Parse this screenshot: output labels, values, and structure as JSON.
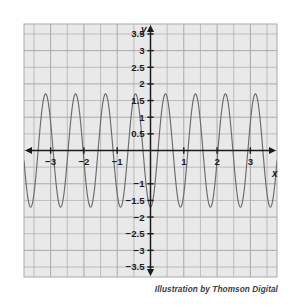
{
  "figure": {
    "caption": "Illustration by Thomson Digital",
    "background_color": "#ffffff",
    "plot_background_color": "#e9e9e9",
    "grid_color": "#a9a9a9",
    "axis_color": "#1c1c1c",
    "curve_color": "#6b6b6b"
  },
  "chart_data": {
    "type": "line",
    "title": "",
    "subtitle": "",
    "xlabel": "x",
    "ylabel": "y",
    "xlim": [
      -3.8,
      3.8
    ],
    "ylim": [
      -3.8,
      3.8
    ],
    "xticks": [
      -3,
      -2,
      -1,
      1,
      2,
      3
    ],
    "xtick_labels": [
      "-3",
      "-2",
      "-1",
      "1",
      "2",
      "3"
    ],
    "yticks": [
      3.5,
      3,
      2.5,
      2,
      1.5,
      1,
      0.5,
      -1,
      -1.5,
      -2,
      -2.5,
      -3,
      -3.5
    ],
    "ytick_labels": [
      "3.5",
      "3",
      "2.5",
      "2",
      "1.5",
      "1",
      "0.5",
      "-1",
      "-1.5",
      "-2",
      "-2.5",
      "-3",
      "-3.5"
    ],
    "grid": true,
    "grid_major_step": 0.5,
    "legend": "none",
    "annotations": [],
    "series": [
      {
        "name": "y = 1.7 cos(7x + pi)",
        "kind": "sinusoid",
        "amplitude": 1.7,
        "period": 0.9,
        "frequency_rad": 6.98,
        "phase_shift_rad": 3.1416,
        "vertical_shift": 0,
        "peaks_x": [
          -3.05,
          -2.15,
          -1.25,
          -0.35,
          0.55,
          1.45,
          2.35,
          3.25
        ],
        "peaks_y": [
          1.7,
          1.7,
          1.7,
          1.7,
          1.7,
          1.7,
          1.7,
          1.7
        ],
        "troughs_x": [
          -3.5,
          -2.6,
          -1.7,
          -0.8,
          0.1,
          1.0,
          1.9,
          2.8,
          3.7
        ],
        "troughs_y": [
          -1.7,
          -1.7,
          -1.7,
          -1.7,
          -1.7,
          -1.7,
          -1.7,
          -1.7,
          -1.7
        ]
      }
    ]
  }
}
